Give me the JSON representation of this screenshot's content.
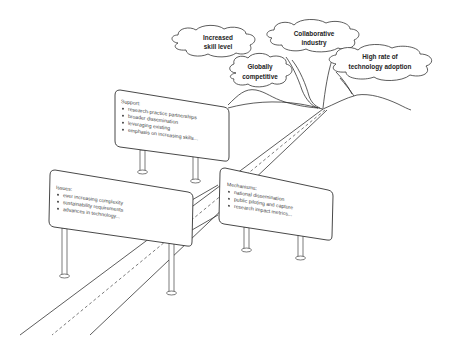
{
  "diagram": {
    "type": "roadmap-illustration",
    "goals": [
      {
        "id": "increased-skill-level",
        "lines": [
          "Increased",
          "skill level"
        ]
      },
      {
        "id": "collaborative-industry",
        "lines": [
          "Collaborative",
          "industry"
        ]
      },
      {
        "id": "globally-competitive",
        "lines": [
          "Globally",
          "competitive"
        ]
      },
      {
        "id": "high-rate-technology-adoption",
        "lines": [
          "High rate of",
          "technology adoption"
        ]
      }
    ],
    "signs": {
      "support": {
        "title": "Support:",
        "items": [
          "research-practice partnerships",
          "broader dissemination",
          "leveraging existing",
          "emphasis on increasing skills..."
        ]
      },
      "issues": {
        "title": "Issues:",
        "items": [
          "ever increasing complexity",
          "sustainability requirements",
          "advances in technology..."
        ]
      },
      "mechanisms": {
        "title": "Mechanisms:",
        "items": [
          "national dissemination",
          "public piloting and capture",
          "research impact metrics..."
        ]
      }
    },
    "colors": {
      "line": "#333333",
      "text": "#444444",
      "background": "#ffffff"
    }
  }
}
